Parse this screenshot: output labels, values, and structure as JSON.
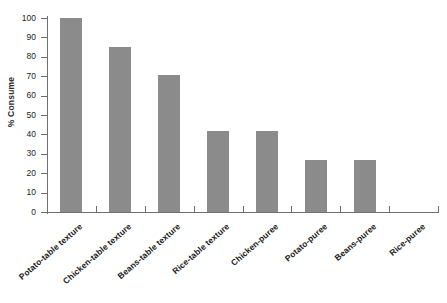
{
  "chart_data": {
    "type": "bar",
    "title": "",
    "subtitle": "",
    "xlabel": "",
    "ylabel": "% Consume",
    "ylim": [
      0,
      100
    ],
    "ytick_labels": [
      "0",
      "10",
      "20",
      "30",
      "40",
      "50",
      "60",
      "70",
      "80",
      "90",
      "100"
    ],
    "ytick_values": [
      0,
      10,
      20,
      30,
      40,
      50,
      60,
      70,
      80,
      90,
      100
    ],
    "grid": false,
    "legend": false,
    "legend_position": "none",
    "bar_color": "#8b8b8b",
    "axis_color": "#6f6f6f",
    "categories": [
      "Potato-table texture",
      "Chicken-table texture",
      "Beans-table texture",
      "Rice-table texture",
      "Chicken-puree",
      "Potato-puree",
      "Beans-puree",
      "Rice-puree"
    ],
    "values": [
      100,
      85,
      70.5,
      42,
      42,
      27,
      27,
      0
    ]
  },
  "caption": {
    "text": ""
  }
}
